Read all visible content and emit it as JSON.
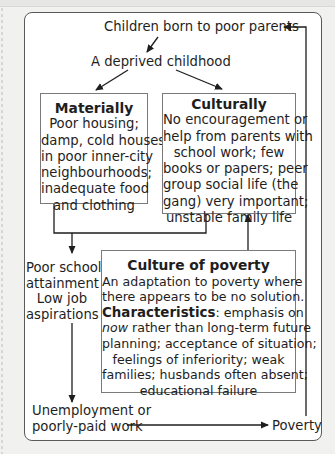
{
  "diagram": {
    "title_node": "Children born to poor parents",
    "deprived": "A deprived childhood",
    "materially": {
      "heading": "Materially",
      "lines": [
        "Poor housing;",
        "damp, cold houses",
        "in poor inner-city",
        "neighbourhoods;",
        "inadequate food",
        "and clothing"
      ]
    },
    "culturally": {
      "heading": "Culturally",
      "lines": [
        "No encouragement or",
        "help from parents with",
        "school work; few",
        "books or papers; peer",
        "group social life (the",
        "gang) very important;",
        "unstable family life"
      ]
    },
    "school": {
      "lines": [
        "Poor school",
        "attainment",
        "Low job",
        "aspirations"
      ]
    },
    "culture_of_poverty": {
      "heading": "Culture of poverty",
      "intro_lines": [
        "An adaptation to poverty where",
        "there appears to be no solution."
      ],
      "characteristics_label": "Characteristics",
      "characteristics_rest": ": emphasis on",
      "now_word": "now",
      "line2_rest": " rather than long-term future",
      "lines": [
        "planning; acceptance of situation;",
        "feelings of inferiority; weak",
        "families; husbands often absent;",
        "educational failure"
      ]
    },
    "unemployment": [
      "Unemployment or",
      "poorly-paid work"
    ],
    "poverty": "Poverty"
  },
  "colors": {
    "background": "#f1f1f0",
    "frame_border": "#5a5a5a",
    "box_border": "#7a7a7a",
    "arrow": "#1e1e1e"
  }
}
